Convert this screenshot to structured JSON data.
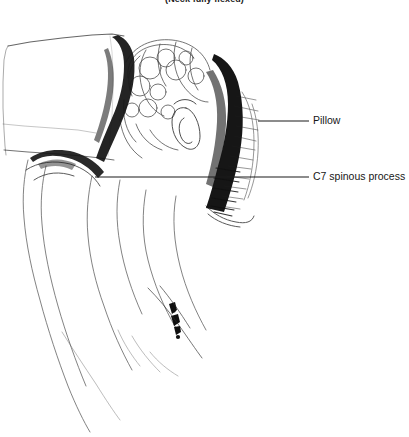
{
  "figure": {
    "caption": "(Neck fully flexed)",
    "width": 409,
    "height": 437,
    "background_color": "#ffffff",
    "ink_color": "#111111",
    "label_color": "#171717",
    "type": "anatomical-line-drawing"
  },
  "labels": [
    {
      "id": "pillow",
      "text": "Pillow",
      "text_x": 313,
      "text_y": 115,
      "leader": {
        "x1": 258,
        "y1": 121,
        "x2": 309,
        "y2": 121
      }
    },
    {
      "id": "c7-spinous-process",
      "text": "C7 spinous process",
      "text_x": 313,
      "text_y": 171,
      "leader": {
        "x1": 95,
        "y1": 177,
        "x2": 309,
        "y2": 177
      }
    }
  ],
  "regions": [
    {
      "name": "pillow-block",
      "description": "large rectangular pillow in upper-left supporting the forehead"
    },
    {
      "name": "head-hair",
      "description": "curly-haired head in profile, center-top"
    },
    {
      "name": "ear",
      "description": "ear detail at center of head"
    },
    {
      "name": "shadow-band",
      "description": "heavy dark vertical shading between head and pillow"
    },
    {
      "name": "neck-back",
      "description": "flexed neck and upper back contour descending to lower-left"
    },
    {
      "name": "spine-marks",
      "description": "small dark vertebral marks along the spine line, lower-center"
    }
  ]
}
